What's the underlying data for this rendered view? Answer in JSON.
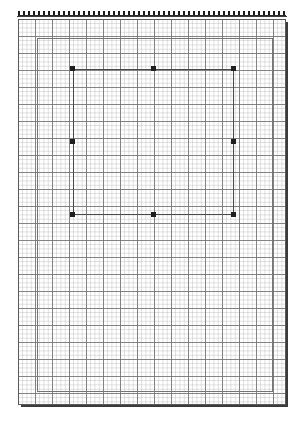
{
  "app": {
    "title": "Page Layout Canvas",
    "background_color": "#ffffff"
  },
  "ruler": {
    "name": "horizontal-ruler",
    "orientation": "horizontal",
    "tick_color": "#1c1c1c",
    "tick_spacing_px": 5,
    "length_px": 268
  },
  "page": {
    "label": "Page",
    "border_color": "#5a5a5a",
    "fill_color": "#ffffff",
    "shadow_color": "#3b3b3b",
    "x": 18,
    "y": 19,
    "width": 268,
    "height": 386
  },
  "grid": {
    "label": "Grid",
    "visible": true,
    "fine_spacing_px": 4.25,
    "major_spacing_px": 17,
    "fine_color": "#969696",
    "major_color": "#6e6e6e"
  },
  "margin_guide": {
    "label": "Margin guide",
    "color": "#757575",
    "x": 37,
    "y": 38,
    "width": 236,
    "height": 354
  },
  "selection": {
    "label": "Selected rectangle",
    "shape_type": "rectangle",
    "stroke_color": "#4a4a4a",
    "fill": "none",
    "x": 73,
    "y": 69,
    "width": 161,
    "height": 146,
    "handle_color": "#1f1f1f",
    "handle_size_px": 5,
    "handles": [
      {
        "id": "nw",
        "label": "Resize handle top-left"
      },
      {
        "id": "n",
        "label": "Resize handle top-center"
      },
      {
        "id": "ne",
        "label": "Resize handle top-right"
      },
      {
        "id": "w",
        "label": "Resize handle middle-left"
      },
      {
        "id": "e",
        "label": "Resize handle middle-right"
      },
      {
        "id": "sw",
        "label": "Resize handle bottom-left"
      },
      {
        "id": "s",
        "label": "Resize handle bottom-center"
      },
      {
        "id": "se",
        "label": "Resize handle bottom-right"
      }
    ]
  }
}
